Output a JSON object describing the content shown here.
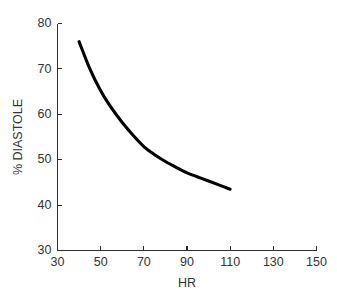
{
  "chart_data": {
    "type": "line",
    "title": "",
    "subtitle": "",
    "xlabel": "HR",
    "ylabel": "% DIASTOLE",
    "xlim": [
      30,
      150
    ],
    "ylim": [
      30,
      80
    ],
    "xticks": [
      30,
      50,
      70,
      90,
      110,
      130,
      150
    ],
    "xtick_labels": [
      "30",
      "50",
      "70",
      "90",
      "110",
      "130",
      "150"
    ],
    "yticks": [
      30,
      40,
      50,
      60,
      70,
      80
    ],
    "ytick_labels": [
      "30",
      "40",
      "50",
      "60",
      "70",
      "80"
    ],
    "grid": false,
    "legend": null,
    "legend_position": "none",
    "annotations": [],
    "series": [
      {
        "name": "% Diastole vs HR",
        "color": "#000000",
        "line_width": 3.1,
        "x": [
          40,
          45,
          50,
          55,
          60,
          65,
          70,
          75,
          80,
          85,
          90,
          95,
          100,
          105,
          110
        ],
        "values": [
          76.0,
          70.0,
          65.2,
          61.4,
          58.2,
          55.4,
          52.9,
          51.1,
          49.6,
          48.3,
          47.1,
          46.2,
          45.3,
          44.4,
          43.5
        ]
      }
    ]
  },
  "axes": {
    "x_title": "HR",
    "y_title": "% DIASTOLE"
  },
  "x_tick_labels": [
    "30",
    "50",
    "70",
    "90",
    "110",
    "130",
    "150"
  ],
  "y_tick_labels": [
    "30",
    "40",
    "50",
    "60",
    "70",
    "80"
  ]
}
